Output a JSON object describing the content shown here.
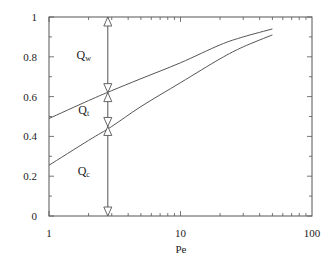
{
  "chart_data": {
    "type": "line",
    "title": "",
    "xlabel": "Pe",
    "ylabel": "",
    "xscale": "log",
    "xlim": [
      1,
      100
    ],
    "ylim": [
      0,
      1
    ],
    "grid": false,
    "legend": null,
    "x_ticks": [
      "1",
      "10",
      "100"
    ],
    "y_ticks": [
      "0",
      "0.2",
      "0.4",
      "0.6",
      "0.8",
      "1"
    ],
    "series": [
      {
        "name": "upper curve",
        "x": [
          1,
          2,
          3,
          5,
          10,
          20,
          30,
          50
        ],
        "y": [
          0.49,
          0.58,
          0.63,
          0.69,
          0.77,
          0.86,
          0.9,
          0.94
        ]
      },
      {
        "name": "lower curve",
        "x": [
          1,
          2,
          3,
          5,
          10,
          20,
          30,
          50
        ],
        "y": [
          0.255,
          0.38,
          0.45,
          0.55,
          0.67,
          0.79,
          0.85,
          0.91
        ]
      }
    ],
    "annotations": [
      {
        "label": "Q",
        "sub": "w",
        "description": "span from upper curve to 1 at Pe≈2.8",
        "y_range": [
          0.62,
          1.0
        ]
      },
      {
        "label": "Q",
        "sub": "t",
        "description": "span between curves at Pe≈2.8",
        "y_range": [
          0.45,
          0.62
        ]
      },
      {
        "label": "Q",
        "sub": "c",
        "description": "span from 0 to lower curve at Pe≈2.8",
        "y_range": [
          0.0,
          0.45
        ]
      }
    ],
    "marker_x": 2.8
  }
}
